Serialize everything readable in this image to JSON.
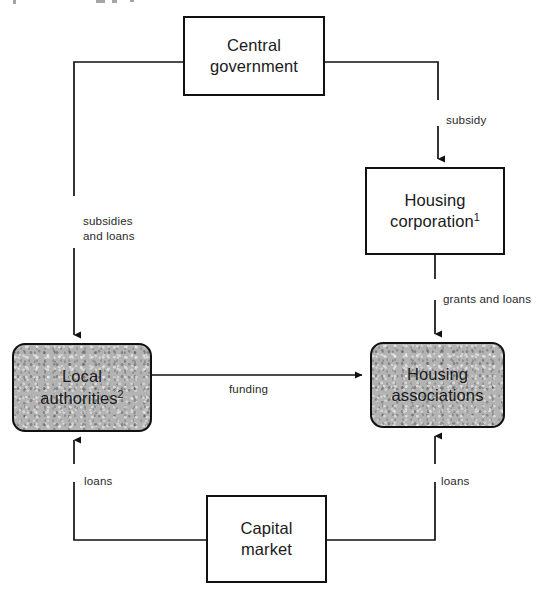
{
  "diagram": {
    "type": "flow-diagram",
    "canvas": {
      "width": 557,
      "height": 593
    },
    "colors": {
      "stroke": "#111111",
      "shaded_fill": "#b3b3b3",
      "plain_fill": "#ffffff",
      "label_text": "#2a2a2a"
    },
    "nodes": [
      {
        "id": "central-government",
        "label": "Central\ngovernment",
        "style": "plain",
        "shape": "rectangle",
        "x": 183,
        "y": 16,
        "w": 142,
        "h": 80
      },
      {
        "id": "housing-corporation",
        "label": "Housing\ncorporation",
        "superscript": "1",
        "style": "plain",
        "shape": "rectangle",
        "x": 365,
        "y": 167,
        "w": 140,
        "h": 88
      },
      {
        "id": "local-authorities",
        "label": "Local\nauthorities",
        "superscript": "2",
        "style": "shaded",
        "shape": "rounded-rectangle",
        "x": 12,
        "y": 343,
        "w": 140,
        "h": 89
      },
      {
        "id": "housing-associations",
        "label": "Housing\nassociations",
        "style": "shaded",
        "shape": "rounded-rectangle",
        "x": 370,
        "y": 342,
        "w": 135,
        "h": 86
      },
      {
        "id": "capital-market",
        "label": "Capital\nmarket",
        "style": "plain",
        "shape": "rectangle",
        "x": 206,
        "y": 495,
        "w": 121,
        "h": 88
      }
    ],
    "edges": [
      {
        "id": "subsidies-and-loans",
        "from": "central-government",
        "to": "local-authorities",
        "label": "subsidies\nand  loans",
        "label_x": 83,
        "label_y": 213
      },
      {
        "id": "subsidy",
        "from": "central-government",
        "to": "housing-corporation",
        "label": "subsidy",
        "label_x": 446,
        "label_y": 112
      },
      {
        "id": "grants-and-loans",
        "from": "housing-corporation",
        "to": "housing-associations",
        "label": "grants and loans",
        "label_x": 443,
        "label_y": 291
      },
      {
        "id": "funding",
        "from": "local-authorities",
        "to": "housing-associations",
        "label": "funding",
        "label_x": 229,
        "label_y": 381
      },
      {
        "id": "loans-to-local-authorities",
        "from": "capital-market",
        "to": "local-authorities",
        "label": "loans",
        "label_x": 84,
        "label_y": 473
      },
      {
        "id": "loans-to-housing-associations",
        "from": "capital-market",
        "to": "housing-associations",
        "label": "loans",
        "label_x": 441,
        "label_y": 473
      }
    ]
  }
}
